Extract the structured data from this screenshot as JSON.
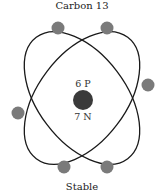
{
  "diagram": {
    "title": "Carbon 13",
    "caption": "Stable",
    "nucleus": {
      "protons_label": "6 P",
      "neutrons_label": "7 N",
      "color": "#3a3a3a"
    },
    "electron_count": 6,
    "electron_color": "#7a7a7a",
    "orbit_color": "#1a1a1a",
    "orbits": 2
  }
}
